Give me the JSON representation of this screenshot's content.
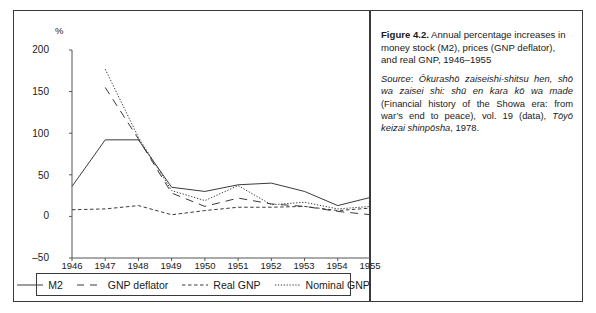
{
  "figure": {
    "axis_unit_label": "%",
    "y_ticks": [
      "200",
      "150",
      "100",
      "50",
      "0",
      "–50"
    ],
    "x_ticks": [
      "1946",
      "1947",
      "1948",
      "1949",
      "1950",
      "1951",
      "1952",
      "1953",
      "1954",
      "1955"
    ],
    "legend": [
      {
        "label": "M2",
        "style": "solid",
        "color": "#3a3a3a"
      },
      {
        "label": "GNP deflator",
        "style": "long-dash",
        "color": "#3a3a3a"
      },
      {
        "label": "Real GNP",
        "style": "short-dash",
        "color": "#3a3a3a"
      },
      {
        "label": "Nominal GNP",
        "style": "dotted",
        "color": "#3a3a3a"
      }
    ]
  },
  "caption": {
    "figure_number": "Figure 4.2.",
    "title_text": " Annual percentage increases in money stock (M2), prices (GNP deflator), and real GNP, 1946–1955",
    "source_label": "Source",
    "source_sep": ": ",
    "source_italic_1": "Ōkurashō zaiseishi-shitsu hen, shō wa zaisei shi: shū en kara kō wa made",
    "source_roman_1": " (Financial history of the Showa era: from war’s end to peace), vol. 19 (data), ",
    "source_italic_2": "Tōyō keizai shinpōsha",
    "source_roman_2": ", 1978."
  },
  "chart_data": {
    "type": "line",
    "title": "Annual percentage increases in money stock (M2), prices (GNP deflator), and real GNP, 1946–1955",
    "xlabel": "",
    "ylabel": "%",
    "ylim": [
      -50,
      200
    ],
    "yticks": [
      -50,
      0,
      50,
      100,
      150,
      200
    ],
    "grid": false,
    "legend_position": "bottom",
    "x": [
      1946,
      1947,
      1948,
      1949,
      1950,
      1951,
      1952,
      1953,
      1954,
      1955
    ],
    "series": [
      {
        "name": "M2",
        "style": "solid",
        "values": [
          36,
          92,
          92,
          35,
          30,
          38,
          40,
          30,
          13,
          23
        ]
      },
      {
        "name": "GNP deflator",
        "style": "long-dash",
        "values": [
          null,
          155,
          93,
          28,
          12,
          22,
          15,
          12,
          6,
          2
        ]
      },
      {
        "name": "Real GNP",
        "style": "short-dash",
        "values": [
          8,
          9,
          13,
          2,
          7,
          11,
          11,
          12,
          7,
          10
        ]
      },
      {
        "name": "Nominal GNP",
        "style": "dotted",
        "values": [
          null,
          177,
          95,
          31,
          19,
          37,
          14,
          17,
          9,
          12
        ]
      }
    ]
  }
}
